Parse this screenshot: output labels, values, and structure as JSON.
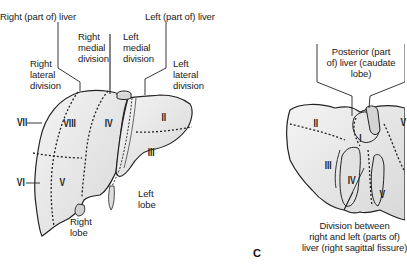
{
  "diagram": {
    "type": "anatomical-illustration",
    "left_view": {
      "labels": {
        "right_part_of_liver": "Right (part of) liver",
        "left_part_of_liver": "Left (part of) liver",
        "right_medial_division": "Right\nmedial\ndivision",
        "left_medial_division": "Left\nmedial\ndivision",
        "right_lateral_division": "Right\nlateral\ndivision",
        "left_lateral_division": "Left\nlateral\ndivision",
        "right_lobe": "Right\nlobe",
        "left_lobe": "Left\nlobe"
      },
      "segments": {
        "II": "II",
        "III": "III",
        "IV": "IV",
        "V": "V",
        "VI": "VI",
        "VII": "VII",
        "VIII": "VIII"
      }
    },
    "right_view": {
      "panel_letter": "C",
      "labels": {
        "posterior_part": "Posterior (part\nof) liver (caudate\nlobe)",
        "division_between": "Division between\nright and left (parts of)\nliver (right sagittal fissure)"
      },
      "segments": {
        "I": "I",
        "II": "II",
        "III": "III",
        "IV": "IV",
        "V": "V",
        "V_edge": "V"
      }
    },
    "colors": {
      "organ_fill": "#e8e8e8",
      "organ_stroke": "#222222",
      "line": "#333333",
      "background": "#ffffff"
    }
  }
}
